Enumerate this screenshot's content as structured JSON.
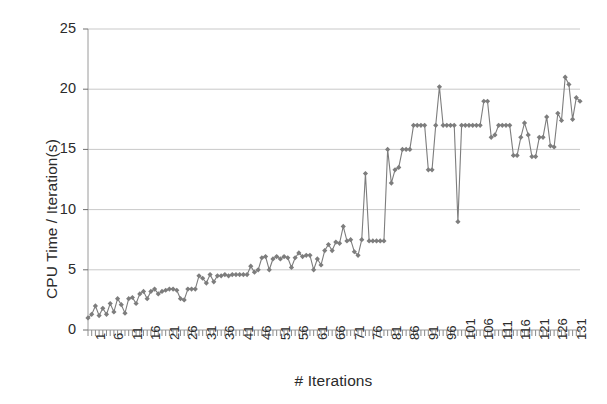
{
  "chart_data": {
    "type": "line",
    "title": "",
    "xlabel": "# Iterations",
    "ylabel": "CPU Time / Iteration(s)",
    "xlim": [
      1,
      134
    ],
    "ylim": [
      0,
      25
    ],
    "yticks": [
      0,
      5,
      10,
      15,
      20,
      25
    ],
    "xticks": [
      1,
      6,
      11,
      16,
      21,
      26,
      31,
      36,
      41,
      46,
      51,
      56,
      61,
      66,
      71,
      76,
      81,
      86,
      91,
      96,
      101,
      106,
      111,
      116,
      121,
      126,
      131
    ],
    "grid": true,
    "legend": false,
    "marker": "diamond",
    "series_color": "#7d7d7d",
    "x": [
      1,
      2,
      3,
      4,
      5,
      6,
      7,
      8,
      9,
      10,
      11,
      12,
      13,
      14,
      15,
      16,
      17,
      18,
      19,
      20,
      21,
      22,
      23,
      24,
      25,
      26,
      27,
      28,
      29,
      30,
      31,
      32,
      33,
      34,
      35,
      36,
      37,
      38,
      39,
      40,
      41,
      42,
      43,
      44,
      45,
      46,
      47,
      48,
      49,
      50,
      51,
      52,
      53,
      54,
      55,
      56,
      57,
      58,
      59,
      60,
      61,
      62,
      63,
      64,
      65,
      66,
      67,
      68,
      69,
      70,
      71,
      72,
      73,
      74,
      75,
      76,
      77,
      78,
      79,
      80,
      81,
      82,
      83,
      84,
      85,
      86,
      87,
      88,
      89,
      90,
      91,
      92,
      93,
      94,
      95,
      96,
      97,
      98,
      99,
      100,
      101,
      102,
      103,
      104,
      105,
      106,
      107,
      108,
      109,
      110,
      111,
      112,
      113,
      114,
      115,
      116,
      117,
      118,
      119,
      120,
      121,
      122,
      123,
      124,
      125,
      126,
      127,
      128,
      129,
      130,
      131,
      132,
      133,
      134
    ],
    "y": [
      1.0,
      1.3,
      2.0,
      1.2,
      1.8,
      1.3,
      2.2,
      1.5,
      2.6,
      2.1,
      1.4,
      2.6,
      2.7,
      2.2,
      3.0,
      3.2,
      2.6,
      3.2,
      3.4,
      3.0,
      3.2,
      3.3,
      3.4,
      3.4,
      3.3,
      2.6,
      2.5,
      3.4,
      3.4,
      3.4,
      4.5,
      4.3,
      3.9,
      4.6,
      4.0,
      4.5,
      4.5,
      4.6,
      4.5,
      4.6,
      4.6,
      4.6,
      4.6,
      4.6,
      5.3,
      4.8,
      5.0,
      6.0,
      6.1,
      5.0,
      5.9,
      6.1,
      5.9,
      6.1,
      6.0,
      5.2,
      6.0,
      6.4,
      6.1,
      6.2,
      6.2,
      5.0,
      5.9,
      5.4,
      6.6,
      7.1,
      6.6,
      7.3,
      7.2,
      8.6,
      7.4,
      7.5,
      6.5,
      6.2,
      7.5,
      13.0,
      7.4,
      7.4,
      7.4,
      7.4,
      7.4,
      15.0,
      12.2,
      13.3,
      13.5,
      15.0,
      15.0,
      15.0,
      17.0,
      17.0,
      17.0,
      17.0,
      13.3,
      13.3,
      17.0,
      20.2,
      17.0,
      17.0,
      17.0,
      17.0,
      9.0,
      17.0,
      17.0,
      17.0,
      17.0,
      17.0,
      17.0,
      19.0,
      19.0,
      16.0,
      16.2,
      17.0,
      17.0,
      17.0,
      17.0,
      14.5,
      14.5,
      16.0,
      17.2,
      16.2,
      14.4,
      14.4,
      16.0,
      16.0,
      17.7,
      15.3,
      15.2,
      18.0,
      17.4,
      21.0,
      20.4,
      17.5,
      19.3,
      19.0,
      20.2,
      19.2,
      19.0,
      19.2,
      16.2,
      19.0,
      19.2,
      22.2,
      20.3,
      19.0,
      20.0
    ],
    "yvalues_note": "134 points, gray line with diamond markers"
  }
}
